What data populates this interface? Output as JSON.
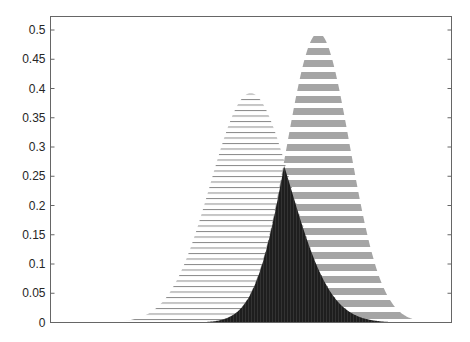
{
  "chart_data": {
    "type": "area",
    "title": "",
    "xlabel": "",
    "ylabel": "",
    "ylim": [
      0,
      0.52
    ],
    "xlim": [
      0,
      1
    ],
    "grid": false,
    "legend": null,
    "yticks": [
      "0",
      "0.05",
      "0.1",
      "0.15",
      "0.2",
      "0.25",
      "0.3",
      "0.35",
      "0.4",
      "0.45",
      "0.5"
    ],
    "ytick_values": [
      0,
      0.05,
      0.1,
      0.15,
      0.2,
      0.25,
      0.3,
      0.35,
      0.4,
      0.45,
      0.5
    ],
    "xticks": [],
    "series": [
      {
        "name": "distribution-1",
        "shape": "gaussian",
        "mean": 0.499,
        "sd": 0.1,
        "peak": 0.392,
        "fill": "thin-horizontal-hatch",
        "color": "#888888"
      },
      {
        "name": "distribution-2",
        "shape": "gaussian",
        "mean": 0.668,
        "sd": 0.079,
        "peak": 0.495,
        "fill": "thick-horizontal-stripes",
        "color": "#a0a0a0"
      },
      {
        "name": "overlap",
        "shape": "min-of-both",
        "peak": 0.233,
        "peak_x": 0.588,
        "fill": "solid-dark",
        "color": "#1a1a1a"
      }
    ],
    "colors": {
      "axis": "#555555",
      "text": "#262626",
      "background": "#ffffff"
    }
  }
}
